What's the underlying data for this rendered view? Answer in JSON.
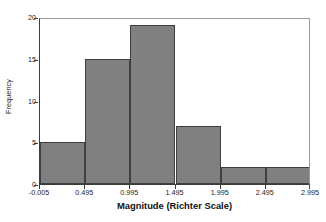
{
  "chart_data": {
    "type": "bar",
    "title": "",
    "subtitle": "",
    "xlabel": "Magnitude (Richter Scale)",
    "ylabel": "Frequency",
    "categories": [
      "-0.005 to 0.495",
      "0.495 to 0.995",
      "0.995 to 1.495",
      "1.495 to 1.995",
      "1.995 to 2.495",
      "2.495 to 2.995"
    ],
    "bin_edges": [
      -0.005,
      0.495,
      0.995,
      1.495,
      1.995,
      2.495,
      2.995
    ],
    "values": [
      5,
      15,
      19,
      7,
      2,
      2
    ],
    "xlim": [
      -0.005,
      2.995
    ],
    "ylim": [
      0,
      20
    ],
    "x_tick_labels": [
      "-0.005",
      "0.495",
      "0.995",
      "1.495",
      "1.995",
      "2.495",
      "2.995"
    ],
    "x_tick_values": [
      -0.005,
      0.495,
      0.995,
      1.495,
      1.995,
      2.495,
      2.995
    ],
    "y_tick_labels": [
      "0",
      "5",
      "10",
      "15",
      "20"
    ],
    "y_tick_values": [
      0,
      5,
      10,
      15,
      20
    ],
    "grid": false,
    "legend": false,
    "legend_position": "none",
    "bar_color": "#808080",
    "bar_edge_color": "#3f3f3f",
    "axis_color": "#3b3b3b",
    "frame_color": "#9a9a9a",
    "background_color": "#ffffff",
    "total_count": 50
  }
}
